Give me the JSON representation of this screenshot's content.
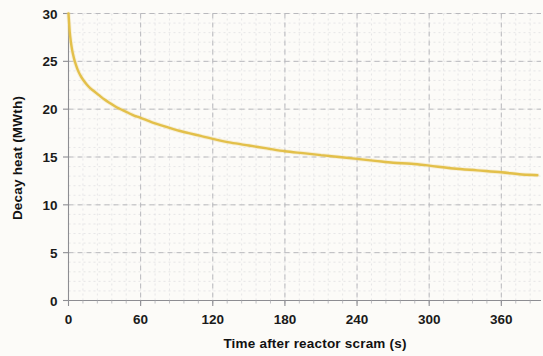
{
  "figure": {
    "background_color": "#fdfdfb",
    "curve_color": "#E3C04A",
    "curve_halo_color": "#EBD694",
    "grid_major_color": "#b9b9bd",
    "grid_minor_color": "#dcdce0",
    "axis_color": "#8d8d92",
    "text_color": "#1a1a1a"
  },
  "chart_data": {
    "type": "line",
    "title": "",
    "xlabel": "Time after reactor  scram (s)",
    "ylabel": "Decay heat (MWth)",
    "xlim": [
      0,
      393
    ],
    "ylim": [
      0,
      30
    ],
    "xticks": [
      0,
      60,
      120,
      180,
      240,
      300,
      360
    ],
    "yticks": [
      0,
      5,
      10,
      15,
      20,
      25,
      30
    ],
    "xtick_labels": [
      "0",
      "60",
      "120",
      "180",
      "240",
      "300",
      "360"
    ],
    "ytick_labels": [
      "0",
      "5",
      "10",
      "15",
      "20",
      "25",
      "30"
    ],
    "x_minor_interval": 12,
    "y_minor_interval": 1,
    "grid": "major and minor dashed",
    "legend": "none",
    "series": [
      {
        "name": "Decay heat",
        "color": "#E3C04A",
        "x": [
          0,
          1,
          2,
          3,
          4,
          5,
          6,
          8,
          10,
          12,
          15,
          18,
          21,
          25,
          30,
          35,
          40,
          45,
          50,
          55,
          60,
          70,
          80,
          90,
          100,
          110,
          120,
          135,
          150,
          165,
          180,
          195,
          210,
          225,
          240,
          255,
          270,
          285,
          300,
          320,
          340,
          360,
          375,
          390
        ],
        "y": [
          30.0,
          28.1,
          27.0,
          26.2,
          25.6,
          25.1,
          24.7,
          24.0,
          23.5,
          23.1,
          22.6,
          22.2,
          21.9,
          21.5,
          21.0,
          20.6,
          20.2,
          19.9,
          19.6,
          19.3,
          19.1,
          18.6,
          18.2,
          17.8,
          17.5,
          17.2,
          16.9,
          16.5,
          16.2,
          15.9,
          15.6,
          15.4,
          15.2,
          15.0,
          14.8,
          14.6,
          14.4,
          14.3,
          14.1,
          13.8,
          13.6,
          13.4,
          13.2,
          13.1
        ]
      }
    ]
  }
}
